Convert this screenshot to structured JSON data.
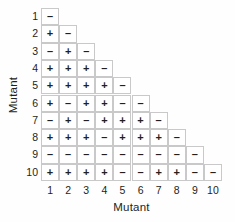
{
  "chart_data": {
    "type": "heatmap",
    "title": "",
    "xlabel": "Mutant",
    "ylabel": "Mutant",
    "x_tick_labels": [
      "1",
      "2",
      "3",
      "4",
      "5",
      "6",
      "7",
      "8",
      "9",
      "10"
    ],
    "y_tick_labels": [
      "1",
      "2",
      "3",
      "4",
      "5",
      "6",
      "7",
      "8",
      "9",
      "10"
    ],
    "categories": [
      "1",
      "2",
      "3",
      "4",
      "5",
      "6",
      "7",
      "8",
      "9",
      "10"
    ],
    "grid": true,
    "legend": "none",
    "cell_symbols": [
      "+",
      "-"
    ],
    "shape": "lower-triangular",
    "rows": [
      {
        "label": "1",
        "values": [
          "-"
        ]
      },
      {
        "label": "2",
        "values": [
          "+",
          "-"
        ]
      },
      {
        "label": "3",
        "values": [
          "-",
          "+",
          "-"
        ]
      },
      {
        "label": "4",
        "values": [
          "+",
          "+",
          "+",
          "-"
        ]
      },
      {
        "label": "5",
        "values": [
          "+",
          "+",
          "+",
          "+",
          "-"
        ]
      },
      {
        "label": "6",
        "values": [
          "+",
          "-",
          "+",
          "+",
          "-",
          "-"
        ]
      },
      {
        "label": "7",
        "values": [
          "-",
          "+",
          "-",
          "+",
          "+",
          "+",
          "-"
        ]
      },
      {
        "label": "8",
        "values": [
          "+",
          "+",
          "+",
          "-",
          "+",
          "+",
          "+",
          "-"
        ]
      },
      {
        "label": "9",
        "values": [
          "-",
          "-",
          "-",
          "-",
          "-",
          "-",
          "-",
          "-",
          "-"
        ]
      },
      {
        "label": "10",
        "values": [
          "+",
          "+",
          "+",
          "+",
          "-",
          "-",
          "+",
          "+",
          "-",
          "-"
        ]
      }
    ]
  },
  "colors": {
    "background": "#fefefe",
    "cell_border": "#c9c9c9",
    "text": "#231f20"
  }
}
